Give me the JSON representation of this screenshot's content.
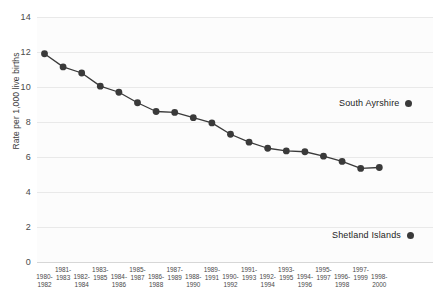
{
  "chart_data": {
    "type": "line",
    "title": "",
    "subtitle": "",
    "xlabel": "",
    "ylabel": "Rate per 1,000 live births",
    "ylim": [
      0,
      14
    ],
    "ytick_values": [
      0,
      2,
      4,
      6,
      8,
      10,
      12,
      14
    ],
    "ytick_labels": [
      "0",
      "2",
      "4",
      "6",
      "8",
      "10",
      "12",
      "14"
    ],
    "grid": true,
    "legend_position": "right",
    "categories": [
      "1980-1982",
      "1981-1983",
      "1982-1984",
      "1983-1985",
      "1984-1986",
      "1985-1987",
      "1986-1988",
      "1987-1989",
      "1988-1990",
      "1989-1991",
      "1990-1992",
      "1991-1993",
      "1992-1994",
      "1993-1995",
      "1994-1996",
      "1995-1997",
      "1996-1998",
      "1997-1999",
      "1998-2000"
    ],
    "series": [
      {
        "name": "South Ayrshire",
        "color": "#3a3a3a",
        "marker": "circle",
        "values": [
          11.9,
          11.15,
          10.8,
          10.05,
          9.7,
          9.1,
          8.6,
          8.55,
          8.25,
          7.95,
          7.3,
          6.85,
          6.5,
          6.35,
          6.3,
          6.05,
          5.75,
          5.35,
          5.4
        ]
      }
    ],
    "annotations": [
      {
        "name": "South Ayrshire",
        "kind": "legend-label"
      },
      {
        "name": "Shetland Islands",
        "kind": "legend-label"
      }
    ]
  },
  "legend": {
    "south_ayrshire": "South Ayrshire",
    "shetland_islands": "Shetland Islands"
  }
}
